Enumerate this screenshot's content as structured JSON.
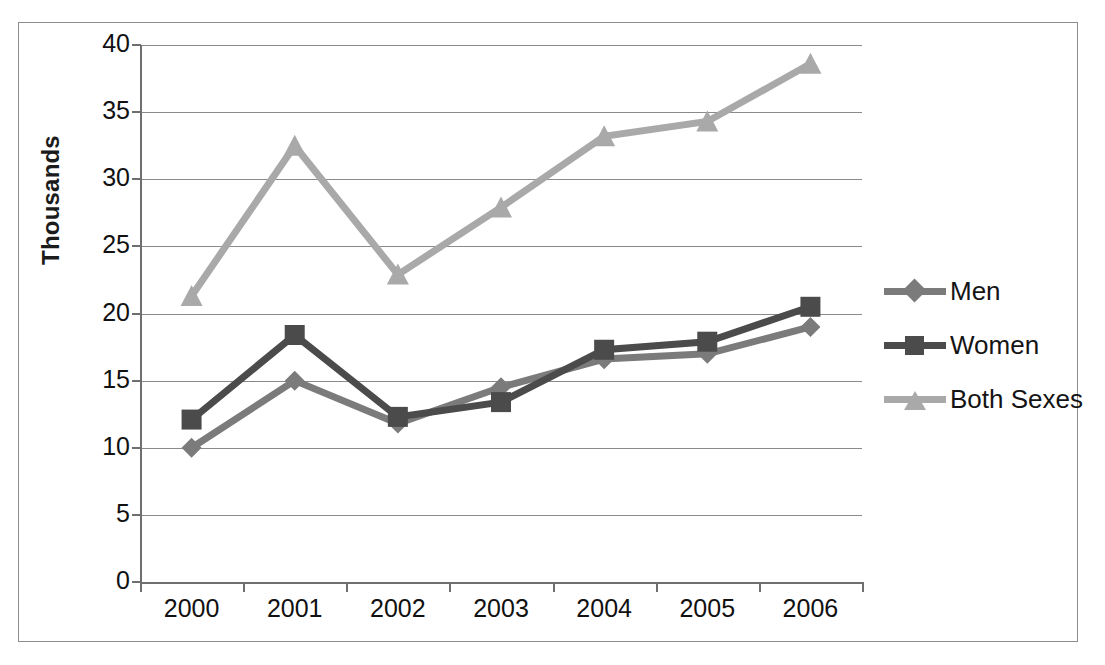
{
  "chart_data": {
    "type": "line",
    "title": "",
    "xlabel": "",
    "ylabel": "Thousands",
    "categories": [
      "2000",
      "2001",
      "2002",
      "2003",
      "2004",
      "2005",
      "2006"
    ],
    "ylim": [
      0,
      40
    ],
    "ytick_step": 5,
    "yticks": [
      "0",
      "5",
      "10",
      "15",
      "20",
      "25",
      "30",
      "35",
      "40"
    ],
    "grid": true,
    "legend_position": "right",
    "series": [
      {
        "name": "Men",
        "marker": "diamond",
        "color": "#7b7b7b",
        "values": [
          10.0,
          15.0,
          11.8,
          14.5,
          16.6,
          17.0,
          19.0
        ]
      },
      {
        "name": "Women",
        "marker": "square",
        "color": "#4b4b4b",
        "values": [
          12.1,
          18.4,
          12.3,
          13.4,
          17.3,
          17.9,
          20.5
        ]
      },
      {
        "name": "Both Sexes",
        "marker": "triangle",
        "color": "#a9a9a9",
        "values": [
          21.3,
          32.5,
          22.9,
          27.9,
          33.2,
          34.3,
          38.6
        ]
      }
    ]
  },
  "legend": {
    "entries": [
      {
        "label": "Men"
      },
      {
        "label": "Women"
      },
      {
        "label": "Both Sexes"
      }
    ]
  },
  "colors": {
    "men": "#7b7b7b",
    "women": "#4b4b4b",
    "both_sexes": "#a9a9a9",
    "gridline": "#8a8a8a",
    "axis": "#6f6f6f",
    "text": "#111111",
    "border": "#8d8d8d",
    "background": "#ffffff"
  }
}
